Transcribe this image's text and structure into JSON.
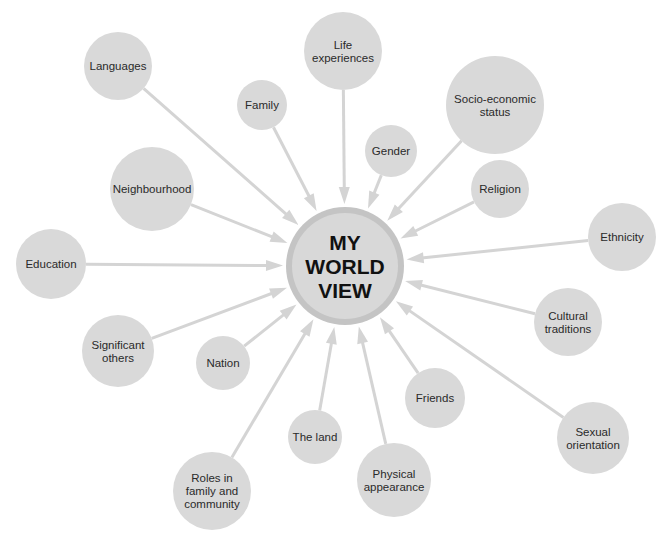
{
  "colors": {
    "background": "#ffffff",
    "node_fill": "#d9d9d9",
    "connector": "#d4d4d4",
    "center_fill": "#d8d8d8",
    "center_ring": "#c4c4c4",
    "text": "#2a2a2a",
    "center_text": "#111111"
  },
  "center": {
    "label_lines": [
      "MY",
      "WORLD",
      "VIEW"
    ],
    "x": 345,
    "y": 266,
    "r": 59,
    "ring_width": 6
  },
  "nodes": [
    {
      "id": "languages",
      "label_lines": [
        "Languages"
      ],
      "x": 118,
      "y": 66,
      "r": 34
    },
    {
      "id": "family",
      "label_lines": [
        "Family"
      ],
      "x": 262,
      "y": 105,
      "r": 25
    },
    {
      "id": "life-experiences",
      "label_lines": [
        "Life",
        "experiences"
      ],
      "x": 343,
      "y": 51,
      "r": 39
    },
    {
      "id": "gender",
      "label_lines": [
        "Gender"
      ],
      "x": 391,
      "y": 151,
      "r": 26
    },
    {
      "id": "socio-economic-status",
      "label_lines": [
        "Socio-economic",
        "status"
      ],
      "x": 495,
      "y": 105,
      "r": 49
    },
    {
      "id": "religion",
      "label_lines": [
        "Religion"
      ],
      "x": 500,
      "y": 189,
      "r": 29
    },
    {
      "id": "ethnicity",
      "label_lines": [
        "Ethnicity"
      ],
      "x": 622,
      "y": 237,
      "r": 34
    },
    {
      "id": "neighbourhood",
      "label_lines": [
        "Neighbourhood"
      ],
      "x": 152,
      "y": 189,
      "r": 42
    },
    {
      "id": "education",
      "label_lines": [
        "Education"
      ],
      "x": 51,
      "y": 264,
      "r": 35
    },
    {
      "id": "significant-others",
      "label_lines": [
        "Significant",
        "others"
      ],
      "x": 118,
      "y": 351,
      "r": 36
    },
    {
      "id": "nation",
      "label_lines": [
        "Nation"
      ],
      "x": 223,
      "y": 363,
      "r": 27
    },
    {
      "id": "cultural-traditions",
      "label_lines": [
        "Cultural",
        "traditions"
      ],
      "x": 568,
      "y": 322,
      "r": 34
    },
    {
      "id": "friends",
      "label_lines": [
        "Friends"
      ],
      "x": 435,
      "y": 398,
      "r": 30
    },
    {
      "id": "sexual-orientation",
      "label_lines": [
        "Sexual",
        "orientation"
      ],
      "x": 593,
      "y": 438,
      "r": 36
    },
    {
      "id": "the-land",
      "label_lines": [
        "The land"
      ],
      "x": 315,
      "y": 437,
      "r": 27
    },
    {
      "id": "roles-in-family-and-community",
      "label_lines": [
        "Roles in",
        "family and",
        "community"
      ],
      "x": 212,
      "y": 491,
      "r": 39
    },
    {
      "id": "physical-appearance",
      "label_lines": [
        "Physical",
        "appearance"
      ],
      "x": 394,
      "y": 480,
      "r": 37
    }
  ]
}
